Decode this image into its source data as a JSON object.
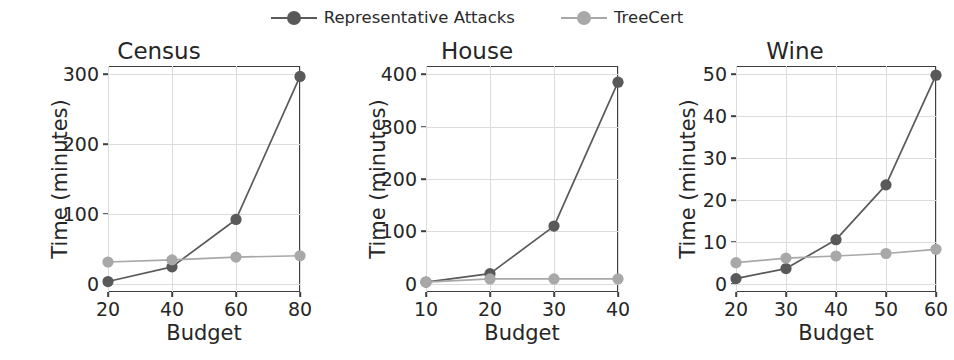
{
  "legend": {
    "position": "top-center",
    "entries": [
      {
        "label": "Representative Attacks",
        "color": "#595959",
        "marker": "circle"
      },
      {
        "label": "TreeCert",
        "color": "#a8a8a8",
        "marker": "circle"
      }
    ]
  },
  "colors": {
    "representative_attacks": "#595959",
    "treecert": "#a8a8a8",
    "axis": "#3f3f3f",
    "grid": "#dcdcdc",
    "text": "#262626",
    "background": "#ffffff"
  },
  "chart_data": [
    {
      "type": "line",
      "title": "Census",
      "xlabel": "Budget",
      "ylabel": "Time (minutes)",
      "x": [
        20,
        40,
        60,
        80
      ],
      "xticks": [
        20,
        40,
        60,
        80
      ],
      "yticks": [
        0,
        100,
        200,
        300
      ],
      "xlim": [
        20,
        80
      ],
      "ylim": [
        -12,
        312
      ],
      "grid": true,
      "series": [
        {
          "name": "Representative Attacks",
          "values": [
            3,
            24,
            92,
            297
          ]
        },
        {
          "name": "TreeCert",
          "values": [
            31,
            34,
            38,
            40
          ]
        }
      ]
    },
    {
      "type": "line",
      "title": "House",
      "xlabel": "Budget",
      "ylabel": "Time (minutes)",
      "x": [
        10,
        20,
        30,
        40
      ],
      "xticks": [
        10,
        20,
        30,
        40
      ],
      "yticks": [
        0,
        100,
        200,
        300,
        400
      ],
      "xlim": [
        10,
        40
      ],
      "ylim": [
        -16,
        416
      ],
      "grid": true,
      "series": [
        {
          "name": "Representative Attacks",
          "values": [
            3,
            19,
            110,
            385
          ]
        },
        {
          "name": "TreeCert",
          "values": [
            3,
            9,
            9,
            9
          ]
        }
      ]
    },
    {
      "type": "line",
      "title": "Wine",
      "xlabel": "Budget",
      "ylabel": "Time (minutes)",
      "x": [
        20,
        30,
        40,
        50,
        60
      ],
      "xticks": [
        20,
        30,
        40,
        50,
        60
      ],
      "yticks": [
        0,
        10,
        20,
        30,
        40,
        50
      ],
      "xlim": [
        20,
        60
      ],
      "ylim": [
        -2,
        52
      ],
      "grid": true,
      "series": [
        {
          "name": "Representative Attacks",
          "values": [
            1.2,
            3.6,
            10.5,
            23.6,
            49.8
          ]
        },
        {
          "name": "TreeCert",
          "values": [
            5.0,
            6.1,
            6.6,
            7.2,
            8.2
          ]
        }
      ]
    }
  ]
}
